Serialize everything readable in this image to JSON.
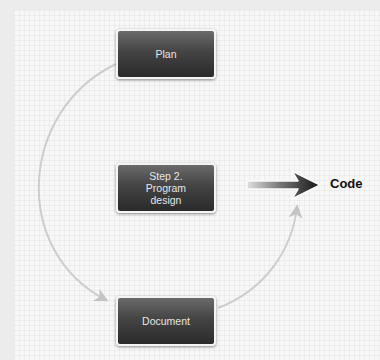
{
  "diagram": {
    "nodes": [
      {
        "id": "plan",
        "label": "Plan"
      },
      {
        "id": "design",
        "label": "Step 2.\nProgram\ndesign"
      },
      {
        "id": "document",
        "label": "Document"
      }
    ],
    "output": {
      "label": "Code"
    },
    "edges": [
      {
        "from": "plan",
        "to": "document",
        "style": "curved-arc-left"
      },
      {
        "from": "document",
        "to": "design-output-arrow",
        "style": "curved-arc-right"
      },
      {
        "from": "design",
        "to": "code",
        "style": "thick-gradient-arrow"
      }
    ],
    "colors": {
      "box_top": "#6a6a6a",
      "box_bottom": "#2a2a2a",
      "box_text": "#e6e6e6",
      "connector": "#c8c8c8",
      "arrow_dark": "#1a1a1a",
      "background": "#f7f7f7"
    }
  }
}
